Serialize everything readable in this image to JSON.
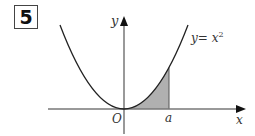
{
  "problem": {
    "number": "5"
  },
  "graph": {
    "curve_label": "y= x",
    "curve_exponent": "2",
    "y_axis_label": "y",
    "x_axis_label": "x",
    "origin_label": "O",
    "point_label": "a",
    "shaded_region": "area under y = x^2 from 0 to a",
    "colors": {
      "curve": "#222222",
      "axis": "#777777",
      "shade": "#b0b0b0"
    }
  }
}
